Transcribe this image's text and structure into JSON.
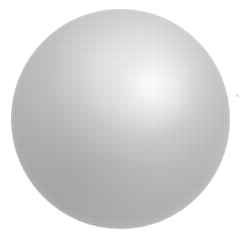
{
  "canvas": {
    "width": 246,
    "height": 245,
    "background_color": "#ffffff",
    "alt_text": "Rendered silver metallic sphere on a white background"
  },
  "subject": {
    "name": "sphere",
    "shape": "circle",
    "label": "Silver sphere",
    "center_x": 120,
    "center_y": 119,
    "radius": 110,
    "bounds": {
      "left": 11,
      "top": 9,
      "width": 219,
      "height": 220
    },
    "material": "brushed silver / chrome",
    "base_color": "#bdbdbd",
    "highlight_color": "#ffffff",
    "midtone_color": "#cfcfcf",
    "shadow_color": "#9a9a9a",
    "rim_color": "#a8a8a8"
  },
  "lighting": {
    "highlight_label": "specular highlight",
    "highlight_x": 150,
    "highlight_y": 85,
    "highlight_radius": 54,
    "light_direction": "upper-right",
    "terminator_label": "terminator shading",
    "terminator_x": 62,
    "terminator_y": 176
  },
  "texture": {
    "label": "dither grain",
    "opacity": 0.055
  },
  "artifacts": [
    {
      "name": "speck",
      "label": "stray pixel speck",
      "x": 236,
      "y": 94,
      "size": 3,
      "color": "#dedede"
    }
  ]
}
